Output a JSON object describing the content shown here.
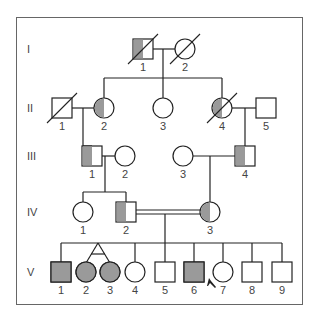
{
  "figure": {
    "type": "pedigree",
    "colors": {
      "affected": "#9a9a9a",
      "line": "#222222",
      "frame": "#666666",
      "background": "#ffffff",
      "label": "#444444"
    }
  },
  "generations": [
    {
      "label": "I",
      "y": 49
    },
    {
      "label": "II",
      "y": 108
    },
    {
      "label": "III",
      "y": 156
    },
    {
      "label": "IV",
      "y": 212
    },
    {
      "label": "V",
      "y": 272
    }
  ],
  "individuals": [
    {
      "id": "I-1",
      "gen": "I",
      "num": "1",
      "sex": "male",
      "x": 143,
      "y": 49,
      "status": "carrier-half",
      "deceased": true
    },
    {
      "id": "I-2",
      "gen": "I",
      "num": "2",
      "sex": "female",
      "x": 185,
      "y": 49,
      "status": "unaffected",
      "deceased": true
    },
    {
      "id": "II-1",
      "gen": "II",
      "num": "1",
      "sex": "male",
      "x": 62,
      "y": 108,
      "status": "unaffected",
      "deceased": true
    },
    {
      "id": "II-2",
      "gen": "II",
      "num": "2",
      "sex": "female",
      "x": 104,
      "y": 108,
      "status": "carrier-half",
      "deceased": false
    },
    {
      "id": "II-3",
      "gen": "II",
      "num": "3",
      "sex": "female",
      "x": 163,
      "y": 108,
      "status": "unaffected",
      "deceased": false
    },
    {
      "id": "II-4",
      "gen": "II",
      "num": "4",
      "sex": "female",
      "x": 222,
      "y": 108,
      "status": "carrier-half",
      "deceased": true
    },
    {
      "id": "II-5",
      "gen": "II",
      "num": "5",
      "sex": "male",
      "x": 266,
      "y": 108,
      "status": "unaffected",
      "deceased": false
    },
    {
      "id": "III-1",
      "gen": "III",
      "num": "1",
      "sex": "male",
      "x": 92,
      "y": 156,
      "status": "carrier-half",
      "deceased": false
    },
    {
      "id": "III-2",
      "gen": "III",
      "num": "2",
      "sex": "female",
      "x": 125,
      "y": 156,
      "status": "unaffected",
      "deceased": false
    },
    {
      "id": "III-3",
      "gen": "III",
      "num": "3",
      "sex": "female",
      "x": 183,
      "y": 156,
      "status": "unaffected",
      "deceased": false
    },
    {
      "id": "III-4",
      "gen": "III",
      "num": "4",
      "sex": "male",
      "x": 245,
      "y": 156,
      "status": "carrier-half",
      "deceased": false
    },
    {
      "id": "IV-1",
      "gen": "IV",
      "num": "1",
      "sex": "female",
      "x": 83,
      "y": 212,
      "status": "unaffected",
      "deceased": false
    },
    {
      "id": "IV-2",
      "gen": "IV",
      "num": "2",
      "sex": "male",
      "x": 126,
      "y": 212,
      "status": "carrier-half",
      "deceased": false
    },
    {
      "id": "IV-3",
      "gen": "IV",
      "num": "3",
      "sex": "female",
      "x": 210,
      "y": 212,
      "status": "carrier-half",
      "deceased": false
    },
    {
      "id": "V-1",
      "gen": "V",
      "num": "1",
      "sex": "male",
      "x": 61,
      "y": 272,
      "status": "affected",
      "deceased": false
    },
    {
      "id": "V-2",
      "gen": "V",
      "num": "2",
      "sex": "female",
      "x": 86,
      "y": 272,
      "status": "affected",
      "deceased": false
    },
    {
      "id": "V-3",
      "gen": "V",
      "num": "3",
      "sex": "female",
      "x": 110,
      "y": 272,
      "status": "affected",
      "deceased": false
    },
    {
      "id": "V-4",
      "gen": "V",
      "num": "4",
      "sex": "female",
      "x": 135,
      "y": 272,
      "status": "unaffected",
      "deceased": false
    },
    {
      "id": "V-5",
      "gen": "V",
      "num": "5",
      "sex": "male",
      "x": 165,
      "y": 272,
      "status": "unaffected",
      "deceased": false
    },
    {
      "id": "V-6",
      "gen": "V",
      "num": "6",
      "sex": "male",
      "x": 194,
      "y": 272,
      "status": "affected",
      "deceased": false,
      "proband": true
    },
    {
      "id": "V-7",
      "gen": "V",
      "num": "7",
      "sex": "female",
      "x": 223,
      "y": 272,
      "status": "unaffected",
      "deceased": false
    },
    {
      "id": "V-8",
      "gen": "V",
      "num": "8",
      "sex": "male",
      "x": 252,
      "y": 272,
      "status": "unaffected",
      "deceased": false
    },
    {
      "id": "V-9",
      "gen": "V",
      "num": "9",
      "sex": "male",
      "x": 282,
      "y": 272,
      "status": "unaffected",
      "deceased": false
    }
  ],
  "matings": [
    {
      "a": "I-1",
      "b": "I-2",
      "consanguineous": false
    },
    {
      "a": "II-1",
      "b": "II-2",
      "consanguineous": false
    },
    {
      "a": "II-4",
      "b": "II-5",
      "consanguineous": false
    },
    {
      "a": "III-1",
      "b": "III-2",
      "consanguineous": false
    },
    {
      "a": "III-3",
      "b": "III-4",
      "consanguineous": false
    },
    {
      "a": "IV-2",
      "b": "IV-3",
      "consanguineous": true
    }
  ],
  "twins": [
    {
      "ids": [
        "V-2",
        "V-3"
      ],
      "type": "monozygotic"
    }
  ],
  "proband_marker": {
    "target": "V-6",
    "symbol": "arrow"
  }
}
